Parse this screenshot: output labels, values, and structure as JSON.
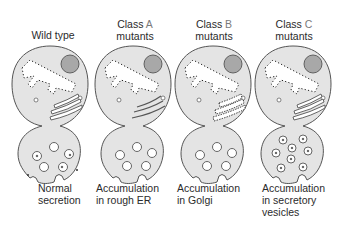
{
  "columns": [
    {
      "id": "wild-type",
      "title_line1": "Wild type",
      "title_line2": "",
      "caption_line1": "Normal",
      "caption_line2": "secretion",
      "caption_line3": ""
    },
    {
      "id": "class-a",
      "title_prefix": "Class",
      "title_letter": "A",
      "title_line2": "mutants",
      "caption_line1": "Accumulation",
      "caption_line2": "in rough ER",
      "caption_line3": ""
    },
    {
      "id": "class-b",
      "title_prefix": "Class",
      "title_letter": "B",
      "title_line2": "mutants",
      "caption_line1": "Accumulation",
      "caption_line2": "in Golgi",
      "caption_line3": ""
    },
    {
      "id": "class-c",
      "title_prefix": "Class",
      "title_letter": "C",
      "title_line2": "mutants",
      "caption_line1": "Accumulation",
      "caption_line2": "in secretory",
      "caption_line3": "vesicles"
    }
  ],
  "colors": {
    "cell_fill": "#e4e4e4",
    "outline": "#555555",
    "nucleus": "#a8a8a8",
    "er_lumen": "#ffffff",
    "ribosome": "#222222",
    "class_letter": "#7a7a7a"
  }
}
